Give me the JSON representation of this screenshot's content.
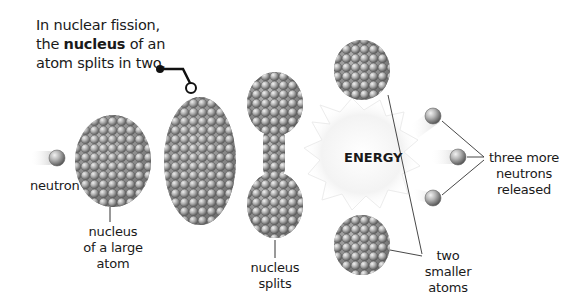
{
  "intro": {
    "line1": "In nuclear fission,",
    "line2_pre": "the ",
    "line2_bold": "nucleus",
    "line2_post": " of an",
    "line3": "atom splits in two."
  },
  "labels": {
    "neutron": "neutron",
    "nucleus_large": [
      "nucleus",
      "of a large",
      "atom"
    ],
    "nucleus_splits": [
      "nucleus",
      "splits"
    ],
    "energy": "ENERGY",
    "three_neutrons": [
      "three more",
      "neutrons",
      "released"
    ],
    "two_atoms": [
      "two",
      "smaller",
      "atoms"
    ]
  },
  "stages": [
    {
      "id": "incoming-neutron"
    },
    {
      "id": "large-nucleus"
    },
    {
      "id": "elongated-nucleus"
    },
    {
      "id": "splitting-nucleus"
    },
    {
      "id": "energy-burst"
    },
    {
      "id": "smaller-atoms"
    },
    {
      "id": "released-neutrons"
    }
  ],
  "colors": {
    "sphere_light": "#d8d8d8",
    "sphere_mid": "#9a9a9a",
    "sphere_dark": "#5a5a5a",
    "line": "#333333",
    "energy_glow": "#f0f0f0"
  }
}
